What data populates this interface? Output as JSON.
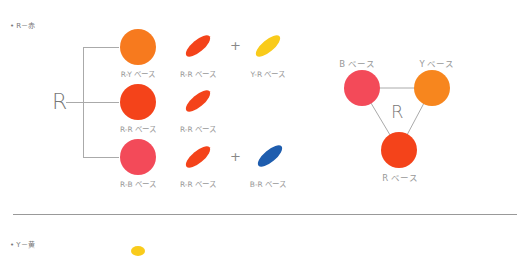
{
  "sections": [
    {
      "title": "• R－赤"
    },
    {
      "title": "• Y－黄"
    }
  ],
  "tree": {
    "root_label": "R",
    "rows": [
      {
        "circle": {
          "color": "#F77A1E",
          "label": "R-Y ベース"
        },
        "ellipse1": {
          "color": "#F4431A",
          "label": "R-R ベース"
        },
        "plus": "+",
        "ellipse2": {
          "color": "#F9CB1B",
          "label": "Y-R ベース"
        }
      },
      {
        "circle": {
          "color": "#F4431A",
          "label": "R-R ベース"
        },
        "ellipse1": {
          "color": "#F4431A",
          "label": "R-R ベース"
        }
      },
      {
        "circle": {
          "color": "#F34A59",
          "label": "R-B ベース"
        },
        "ellipse1": {
          "color": "#F4431A",
          "label": "R-R ベース"
        },
        "plus": "+",
        "ellipse2": {
          "color": "#1E5DAE",
          "label": "B-R ベース"
        }
      }
    ]
  },
  "triangle": {
    "center_label": "R",
    "nodes": [
      {
        "label": "B ベース",
        "color": "#F34A59"
      },
      {
        "label": "Y ベース",
        "color": "#F7861E"
      },
      {
        "label": "R ベース",
        "color": "#F4431A"
      }
    ]
  },
  "colors": {
    "divider": "#999999",
    "yellow_peek": "#F9CB1B"
  }
}
